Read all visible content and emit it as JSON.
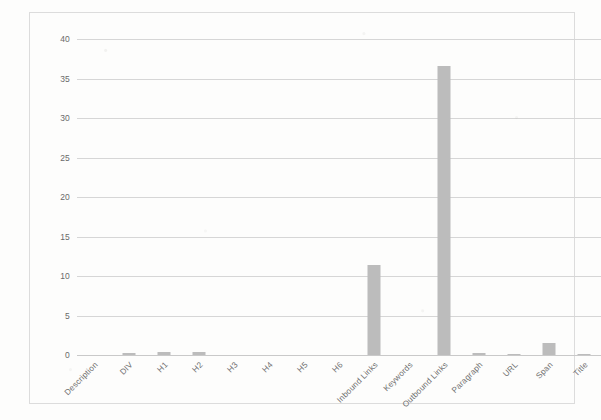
{
  "chart_data": {
    "type": "bar",
    "title": "",
    "subtitle": "",
    "xlabel": "",
    "ylabel": "",
    "ylim": [
      0,
      40
    ],
    "ytick_step": 5,
    "yticks": [
      "0",
      "5",
      "10",
      "15",
      "20",
      "25",
      "30",
      "35",
      "40"
    ],
    "grid": true,
    "legend": false,
    "legend_position": "none",
    "bar_color": "#bcbcbc",
    "gridline_color": "#d6d6d6",
    "frame_color": "#dcdcdc",
    "categories": [
      "Description",
      "DIV",
      "H1",
      "H2",
      "H3",
      "H4",
      "H5",
      "H6",
      "Inbound Links",
      "Keywords",
      "Outbound Links",
      "Paragraph",
      "URL",
      "Span",
      "Title"
    ],
    "values": [
      0,
      0.2,
      0.35,
      0.4,
      0,
      0,
      0,
      0,
      11.4,
      0,
      36.6,
      0.2,
      0.15,
      1.5,
      0.1
    ]
  }
}
